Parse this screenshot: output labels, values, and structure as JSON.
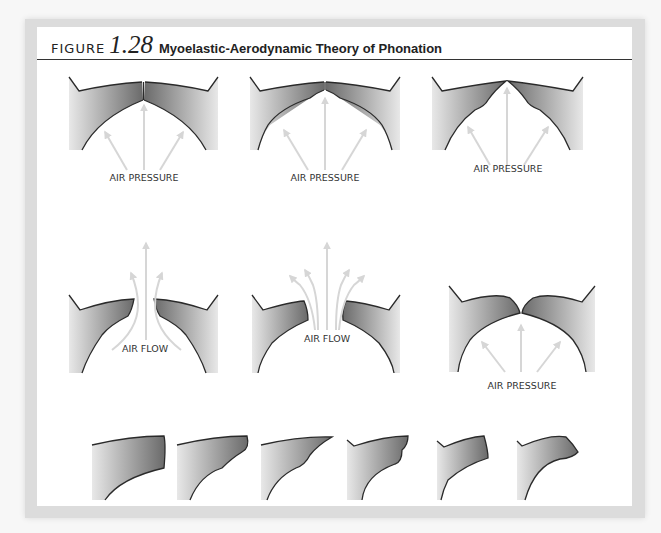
{
  "figure": {
    "label": "FIGURE",
    "number": "1.28",
    "title": "Myoelastic-Aerodynamic Theory of Phonation"
  },
  "panels": [
    {
      "id": "closed-1",
      "label": "AIR PRESSURE",
      "state": "vocal folds closed, subglottal pressure building"
    },
    {
      "id": "closed-2",
      "label": "AIR PRESSURE",
      "state": "pressure pushes lower edges apart"
    },
    {
      "id": "closed-3",
      "label": "AIR PRESSURE",
      "state": "folds bulge upward"
    },
    {
      "id": "open-1",
      "label": "AIR FLOW",
      "state": "folds open, air flows through"
    },
    {
      "id": "open-2",
      "label": "AIR FLOW",
      "state": "folds fully open, air flow spreads"
    },
    {
      "id": "closing",
      "label": "AIR PRESSURE",
      "state": "folds close again"
    }
  ],
  "sequence": {
    "count": 6,
    "description": "Cross-section sequence of one vocal fold through a vibratory cycle"
  },
  "colors": {
    "fold_dark": "#6e6e6e",
    "fold_light": "#e6e6e6",
    "outline": "#2a2a2a",
    "arrow": "#d6d6d6",
    "frame": "#dcdcdc"
  }
}
